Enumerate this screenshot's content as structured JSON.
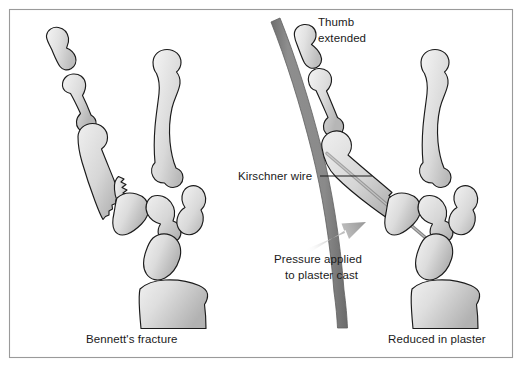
{
  "figure": {
    "title_semantic": "bennetts-fracture-and-reduction-in-plaster",
    "background_color": "#ffffff",
    "frame_color": "#9a9a9a",
    "outline_color": "#1b1b1b",
    "bone_fill_light": "#efefef",
    "bone_fill_mid": "#d2d2d2",
    "bone_fill_dark": "#b4b4b4",
    "plaster_color": "#8c8c8c",
    "plaster_edge_color": "#6f6f6f",
    "wire_color": "#8f8f8f",
    "arrow_color": "#9b9b9b"
  },
  "panels": {
    "left": {
      "caption": "Bennett's fracture"
    },
    "right": {
      "caption": "Reduced in plaster"
    }
  },
  "annotations": {
    "thumb_extended": {
      "line1": "Thumb",
      "line2": "extended"
    },
    "kirschner_wire": {
      "label": "Kirschner wire"
    },
    "pressure": {
      "line1": "Pressure applied",
      "line2": "to plaster cast"
    }
  }
}
